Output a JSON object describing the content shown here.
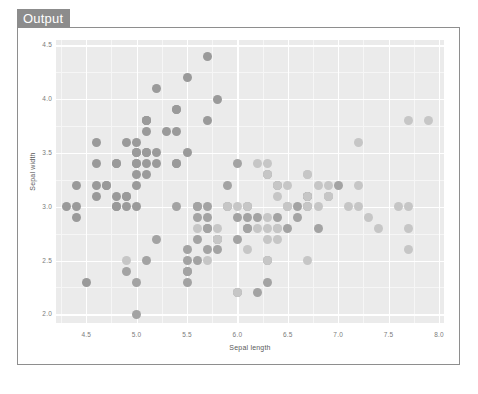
{
  "panel": {
    "tab_label": "Output"
  },
  "chart_data": {
    "type": "scatter",
    "title": "",
    "xlabel": "Sepal length",
    "ylabel": "Sepal width",
    "xlim": [
      4.2,
      8.05
    ],
    "ylim": [
      1.92,
      4.55
    ],
    "xticks": [
      "4.5",
      "5.0",
      "5.5",
      "6.0",
      "6.5",
      "7.0",
      "7.5",
      "8.0"
    ],
    "xtick_values": [
      4.5,
      5.0,
      5.5,
      6.0,
      6.5,
      7.0,
      7.5,
      8.0
    ],
    "yticks": [
      "4.5",
      "4.0",
      "3.5",
      "3.0",
      "2.5",
      "2.0"
    ],
    "ytick_values": [
      4.5,
      4.0,
      3.5,
      3.0,
      2.5,
      2.0
    ],
    "grid": true,
    "legend": "none",
    "panel_background": "#ebebeb",
    "grid_color": "#ffffff",
    "point_color_dark": "#9a9a9a",
    "point_color_light": "#c6c6c6",
    "point_size": 9,
    "series": [
      {
        "name": "group-dark",
        "color": "#9a9a9a",
        "points": [
          [
            5.1,
            3.5
          ],
          [
            4.9,
            3.0
          ],
          [
            4.7,
            3.2
          ],
          [
            4.6,
            3.1
          ],
          [
            5.0,
            3.6
          ],
          [
            5.4,
            3.9
          ],
          [
            4.6,
            3.4
          ],
          [
            5.0,
            3.4
          ],
          [
            4.4,
            2.9
          ],
          [
            4.9,
            3.1
          ],
          [
            5.4,
            3.7
          ],
          [
            4.8,
            3.4
          ],
          [
            4.8,
            3.0
          ],
          [
            4.3,
            3.0
          ],
          [
            5.8,
            4.0
          ],
          [
            5.7,
            4.4
          ],
          [
            5.4,
            3.9
          ],
          [
            5.1,
            3.5
          ],
          [
            5.7,
            3.8
          ],
          [
            5.1,
            3.8
          ],
          [
            5.4,
            3.4
          ],
          [
            5.1,
            3.7
          ],
          [
            4.6,
            3.6
          ],
          [
            5.1,
            3.3
          ],
          [
            4.8,
            3.4
          ],
          [
            5.0,
            3.0
          ],
          [
            5.0,
            3.4
          ],
          [
            5.2,
            3.5
          ],
          [
            5.2,
            3.4
          ],
          [
            4.7,
            3.2
          ],
          [
            4.8,
            3.1
          ],
          [
            5.4,
            3.4
          ],
          [
            5.2,
            4.1
          ],
          [
            5.5,
            4.2
          ],
          [
            4.9,
            3.1
          ],
          [
            5.0,
            3.2
          ],
          [
            5.5,
            3.5
          ],
          [
            4.9,
            3.6
          ],
          [
            4.4,
            3.0
          ],
          [
            5.1,
            3.4
          ],
          [
            5.0,
            3.5
          ],
          [
            4.5,
            2.3
          ],
          [
            4.4,
            3.2
          ],
          [
            5.0,
            3.5
          ],
          [
            5.1,
            3.8
          ],
          [
            4.8,
            3.0
          ],
          [
            5.1,
            3.8
          ],
          [
            4.6,
            3.2
          ],
          [
            5.3,
            3.7
          ],
          [
            5.0,
            3.3
          ]
        ]
      },
      {
        "name": "group-mid",
        "color": "#a3a3a3",
        "points": [
          [
            7.0,
            3.2
          ],
          [
            6.4,
            3.2
          ],
          [
            6.9,
            3.1
          ],
          [
            5.5,
            2.3
          ],
          [
            6.5,
            2.8
          ],
          [
            5.7,
            2.8
          ],
          [
            6.3,
            3.3
          ],
          [
            4.9,
            2.4
          ],
          [
            6.6,
            2.9
          ],
          [
            5.2,
            2.7
          ],
          [
            5.0,
            2.0
          ],
          [
            5.9,
            3.0
          ],
          [
            6.0,
            2.2
          ],
          [
            6.1,
            2.9
          ],
          [
            5.6,
            2.9
          ],
          [
            6.7,
            3.1
          ],
          [
            5.6,
            3.0
          ],
          [
            5.8,
            2.7
          ],
          [
            6.2,
            2.2
          ],
          [
            5.6,
            2.5
          ],
          [
            5.9,
            3.2
          ],
          [
            6.1,
            2.8
          ],
          [
            6.3,
            2.5
          ],
          [
            6.1,
            2.8
          ],
          [
            6.4,
            2.9
          ],
          [
            6.6,
            3.0
          ],
          [
            6.8,
            2.8
          ],
          [
            6.7,
            3.0
          ],
          [
            6.0,
            2.9
          ],
          [
            5.7,
            2.6
          ],
          [
            5.5,
            2.4
          ],
          [
            5.5,
            2.4
          ],
          [
            5.8,
            2.7
          ],
          [
            6.0,
            2.7
          ],
          [
            5.4,
            3.0
          ],
          [
            6.0,
            3.4
          ],
          [
            6.7,
            3.1
          ],
          [
            6.3,
            2.3
          ],
          [
            5.6,
            3.0
          ],
          [
            5.5,
            2.5
          ],
          [
            5.5,
            2.6
          ],
          [
            6.1,
            3.0
          ],
          [
            5.8,
            2.6
          ],
          [
            5.0,
            2.3
          ],
          [
            5.6,
            2.7
          ],
          [
            5.7,
            3.0
          ],
          [
            5.7,
            2.9
          ],
          [
            6.2,
            2.9
          ],
          [
            5.1,
            2.5
          ],
          [
            5.7,
            2.8
          ]
        ]
      },
      {
        "name": "group-light",
        "color": "#c6c6c6",
        "points": [
          [
            6.3,
            3.3
          ],
          [
            5.8,
            2.7
          ],
          [
            7.1,
            3.0
          ],
          [
            6.3,
            2.9
          ],
          [
            6.5,
            3.0
          ],
          [
            7.6,
            3.0
          ],
          [
            4.9,
            2.5
          ],
          [
            7.3,
            2.9
          ],
          [
            6.7,
            2.5
          ],
          [
            7.2,
            3.6
          ],
          [
            6.5,
            3.2
          ],
          [
            6.4,
            2.7
          ],
          [
            6.8,
            3.0
          ],
          [
            5.7,
            2.5
          ],
          [
            5.8,
            2.8
          ],
          [
            6.4,
            3.2
          ],
          [
            6.5,
            3.0
          ],
          [
            7.7,
            3.8
          ],
          [
            7.7,
            2.6
          ],
          [
            6.0,
            2.2
          ],
          [
            6.9,
            3.2
          ],
          [
            5.6,
            2.8
          ],
          [
            7.7,
            2.8
          ],
          [
            6.3,
            2.7
          ],
          [
            6.7,
            3.3
          ],
          [
            7.2,
            3.2
          ],
          [
            6.2,
            2.8
          ],
          [
            6.1,
            3.0
          ],
          [
            6.4,
            2.8
          ],
          [
            7.2,
            3.0
          ],
          [
            7.4,
            2.8
          ],
          [
            7.9,
            3.8
          ],
          [
            6.4,
            2.8
          ],
          [
            6.3,
            2.8
          ],
          [
            6.1,
            2.6
          ],
          [
            7.7,
            3.0
          ],
          [
            6.3,
            3.4
          ],
          [
            6.4,
            3.1
          ],
          [
            6.0,
            3.0
          ],
          [
            6.9,
            3.1
          ],
          [
            6.7,
            3.1
          ],
          [
            6.9,
            3.1
          ],
          [
            5.8,
            2.7
          ],
          [
            6.8,
            3.2
          ],
          [
            6.7,
            3.3
          ],
          [
            6.7,
            3.0
          ],
          [
            6.3,
            2.5
          ],
          [
            6.5,
            3.0
          ],
          [
            6.2,
            3.4
          ],
          [
            5.9,
            3.0
          ]
        ]
      }
    ]
  }
}
